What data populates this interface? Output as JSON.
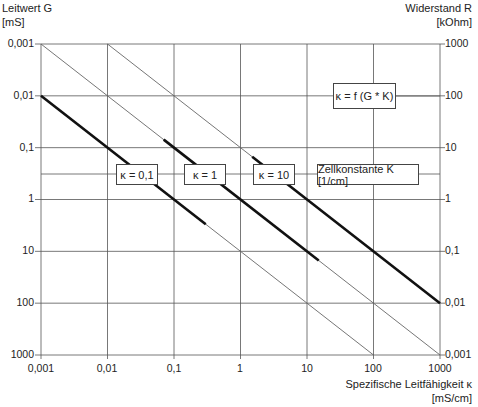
{
  "chart_data": {
    "type": "line",
    "title": "κ = f (G * K)",
    "xlabel": "Spezifische Leitfähigkeit κ [mS/cm]",
    "ylabel_left": "Leitwert G [mS]",
    "ylabel_right": "Widerstand R [kOhm]",
    "xscale": "log",
    "yscale": "log",
    "xlim": [
      0.001,
      1000
    ],
    "ylim_left": [
      0.001,
      1000
    ],
    "ylim_left_inverted": true,
    "ylim_right": [
      1000,
      0.001
    ],
    "grid": true,
    "x_ticks": [
      "0,001",
      "0,01",
      "0,1",
      "1",
      "10",
      "100",
      "1000"
    ],
    "y_left_ticks": [
      "0,001",
      "0,01",
      "0,1",
      "1",
      "10",
      "100",
      "1000"
    ],
    "y_right_ticks": [
      "1000",
      "100",
      "10",
      "1",
      "0,1",
      "0,01",
      "0,001"
    ],
    "legend_title": "Zellkonstante K [1/cm]",
    "series": [
      {
        "name": "κ = 0,1",
        "cell_constant": 0.1,
        "relation": "G = κ / K",
        "x": [
          0.001,
          0.01,
          0.1,
          1,
          10,
          100
        ],
        "y": [
          0.01,
          0.1,
          1,
          10,
          100,
          1000
        ],
        "thick_range_x": [
          0.001,
          0.3
        ]
      },
      {
        "name": "κ = 1",
        "cell_constant": 1,
        "relation": "G = κ / K",
        "x": [
          0.001,
          0.01,
          0.1,
          1,
          10,
          100,
          1000
        ],
        "y": [
          0.001,
          0.01,
          0.1,
          1,
          10,
          100,
          1000
        ],
        "thick_range_x": [
          0.07,
          15
        ]
      },
      {
        "name": "κ = 10",
        "cell_constant": 10,
        "relation": "G = κ / K",
        "x": [
          0.01,
          0.1,
          1,
          10,
          100,
          1000
        ],
        "y": [
          0.001,
          0.01,
          0.1,
          1,
          10,
          100
        ],
        "thick_range_x": [
          1.5,
          1000
        ]
      }
    ]
  },
  "labels": {
    "left_axis_title": "Leitwert G",
    "left_axis_unit": "[mS]",
    "right_axis_title": "Widerstand R",
    "right_axis_unit": "[kOhm]",
    "x_axis_title": "Spezifische Leitfähigkeit κ",
    "x_axis_unit": "[mS/cm]",
    "formula_box": "κ = f (G * K)",
    "legend_k01": "κ = 0,1",
    "legend_k1": "κ = 1",
    "legend_k10": "κ = 10",
    "legend_title": "Zellkonstante K [1/cm]"
  }
}
